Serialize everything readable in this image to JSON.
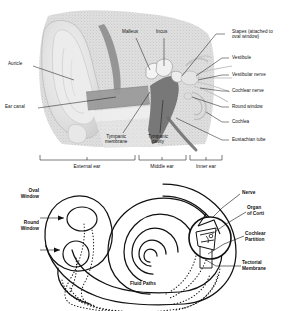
{
  "figure": {
    "background_color": "#ffffff",
    "line_color": "#111111",
    "text_color": "#111111"
  },
  "upper_diagram": {
    "name": "ear-cross-section",
    "description": "Grayscale histological cross-section of the human ear showing external, middle and inner ear",
    "labels_left": [
      {
        "id": "auricle",
        "text": "Auricle",
        "x": 8,
        "y": 63
      },
      {
        "id": "ear-canal",
        "text": "Ear canal",
        "x": 6,
        "y": 106
      }
    ],
    "labels_top": [
      {
        "id": "malleus",
        "text": "Malleus",
        "x": 124,
        "y": 30
      },
      {
        "id": "incus",
        "text": "Incus",
        "x": 157,
        "y": 30
      }
    ],
    "labels_right": [
      {
        "id": "stapes",
        "text": "Stapes (attached to\noval window)",
        "x": 232,
        "y": 31
      },
      {
        "id": "vestibule",
        "text": "Vestibule",
        "x": 232,
        "y": 55
      },
      {
        "id": "vestibular-nerve",
        "text": "Vestibular nerve",
        "x": 232,
        "y": 72
      },
      {
        "id": "cochlear-nerve",
        "text": "Cochlear nerve",
        "x": 232,
        "y": 88
      },
      {
        "id": "round-window",
        "text": "Round window",
        "x": 232,
        "y": 104
      },
      {
        "id": "cochlea",
        "text": "Cochlea",
        "x": 232,
        "y": 119
      },
      {
        "id": "eustachian-tube",
        "text": "Eustachian tube",
        "x": 232,
        "y": 137
      }
    ],
    "labels_bottom": [
      {
        "id": "tympanic-membrane",
        "text": "Tympanic\nmembrane",
        "x": 110,
        "y": 137
      },
      {
        "id": "tympanic-cavity",
        "text": "Tympanic\ncavity",
        "x": 152,
        "y": 137
      }
    ],
    "scale_regions": [
      {
        "id": "external-ear",
        "text": "External ear",
        "start": 40,
        "end": 135
      },
      {
        "id": "middle-ear",
        "text": "Middle ear",
        "start": 138,
        "end": 186
      },
      {
        "id": "inner-ear",
        "text": "Inner ear",
        "start": 189,
        "end": 222
      }
    ]
  },
  "lower_diagram": {
    "name": "cochlea-schematic",
    "description": "Line drawing of the uncoiled cochlea spiral with vestibule, windows, fluid paths and cross-section of the organ of Corti",
    "labels": [
      {
        "id": "oval-window",
        "text": "Oval\nWindow",
        "x": 14,
        "y": 189
      },
      {
        "id": "round-window",
        "text": "Round\nWindow",
        "x": 12,
        "y": 224
      },
      {
        "id": "nerve",
        "text": "Nerve",
        "x": 243,
        "y": 190
      },
      {
        "id": "organ-of-corti",
        "text": "Organ\nof Corti",
        "x": 248,
        "y": 207
      },
      {
        "id": "cochlear-partition",
        "text": "Cochlear\nPartition",
        "x": 246,
        "y": 232
      },
      {
        "id": "tectorial-membrane",
        "text": "Tectorial\nMembrane",
        "x": 243,
        "y": 261
      },
      {
        "id": "fluid-paths",
        "text": "Fluid Paths",
        "x": 130,
        "y": 283
      }
    ]
  }
}
